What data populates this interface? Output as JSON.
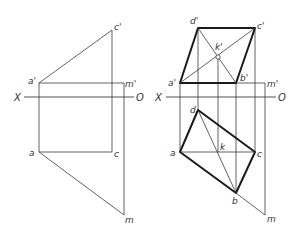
{
  "figure": {
    "left_view": {
      "axis": {
        "left_label": "X",
        "right_label": "O"
      },
      "points": {
        "a_prime": "a'",
        "c_prime": "c'",
        "m_prime": "m'",
        "a": "a",
        "c": "c",
        "m": "m"
      }
    },
    "right_view": {
      "axis": {
        "left_label": "X",
        "right_label": "O"
      },
      "points": {
        "d_prime": "d'",
        "c_prime": "c'",
        "k_prime": "k'",
        "a_prime": "a'",
        "b_prime": "b'",
        "m_prime": "m'",
        "d": "d",
        "a": "a",
        "k": "k",
        "c": "c",
        "b": "b",
        "m": "m"
      }
    }
  },
  "colors": {
    "line": "#3a3a3a",
    "thick": "#1a1a1a",
    "background": "#ffffff"
  }
}
